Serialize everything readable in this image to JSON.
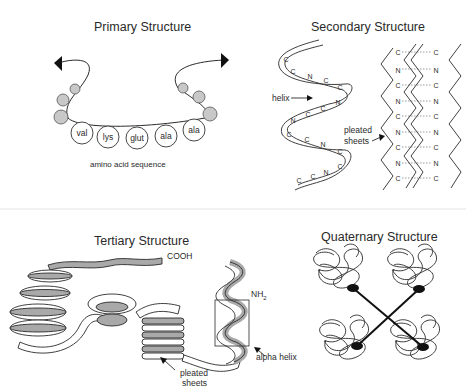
{
  "figure": {
    "panels": {
      "primary": {
        "title": "Primary Structure",
        "amino_acids": [
          "val",
          "lys",
          "glut",
          "ala",
          "ala"
        ],
        "caption": "amino acid sequence"
      },
      "secondary": {
        "title": "Secondary Structure",
        "helix_label": "helix",
        "sheets_label_line1": "pleated",
        "sheets_label_line2": "sheets",
        "helix_atoms": [
          [
            "C"
          ],
          [
            "C",
            "N",
            "C",
            "C"
          ],
          [
            "N",
            "C",
            "C",
            "N"
          ],
          [
            "C",
            "C",
            "N",
            "C"
          ],
          [
            "C",
            "C",
            "N",
            "C"
          ]
        ],
        "sheet_atoms": [
          "C",
          "N",
          "C",
          "N",
          "C",
          "N",
          "C",
          "N",
          "C"
        ]
      },
      "tertiary": {
        "title": "Tertiary Structure",
        "cooh_label": "COOH",
        "nh2_label": "NH",
        "nh2_subscript": "2",
        "alpha_helix_label": "alpha helix",
        "sheets_label_line1": "pleated",
        "sheets_label_line2": "sheets"
      },
      "quaternary": {
        "title": "Quaternary Structure",
        "subunit_count": 4
      }
    },
    "colors": {
      "ink": "#2a2a2a",
      "bead_fill": "#c8c8c8",
      "ribbon_shade": "#a9a9a9",
      "background": "#ffffff"
    }
  }
}
